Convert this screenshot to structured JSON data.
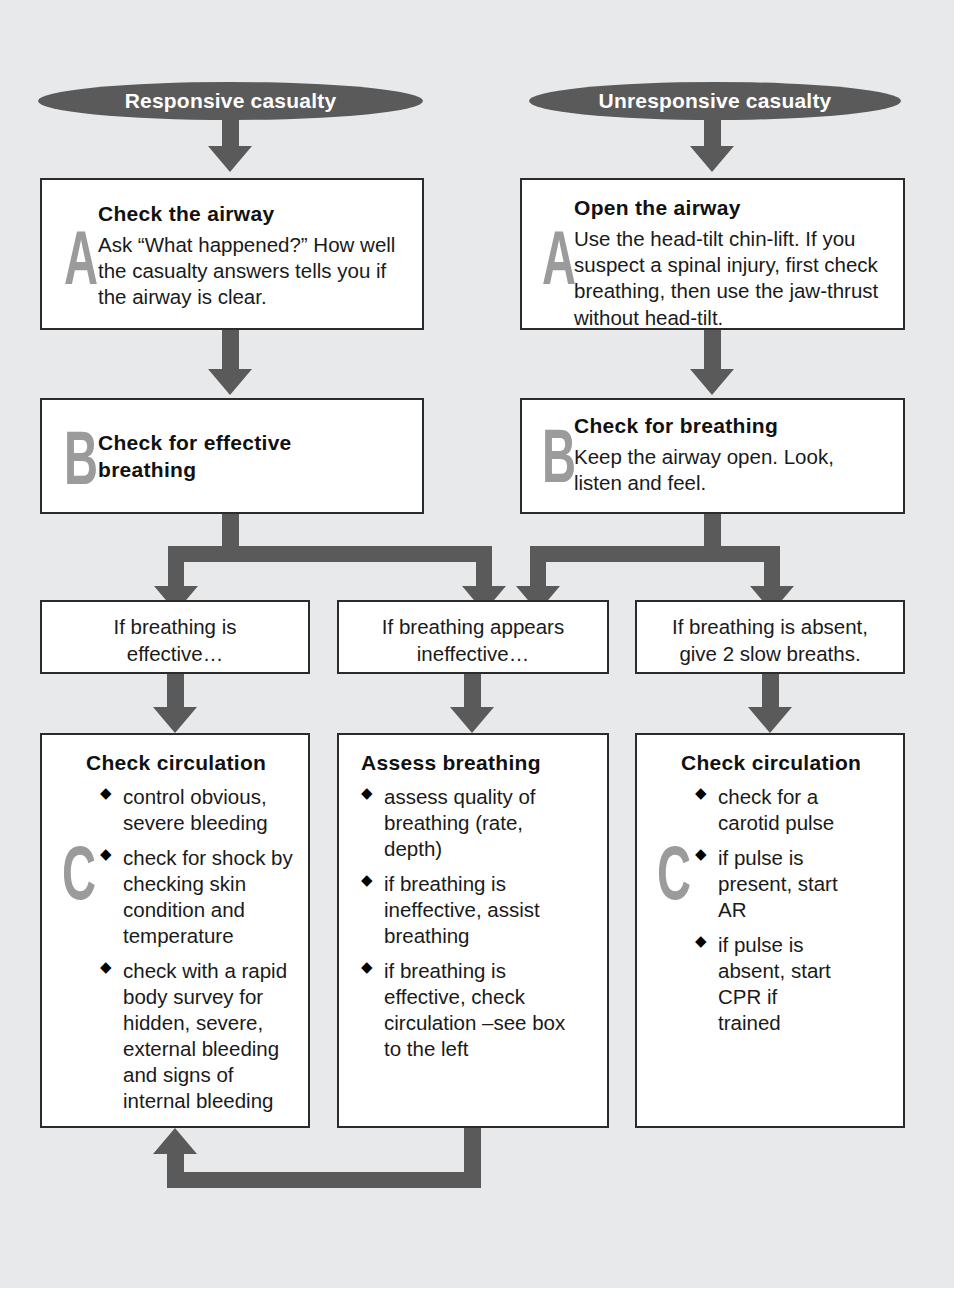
{
  "colors": {
    "background": "#e8e9ea",
    "arrow": "#5a5a5a",
    "ellipse_fill": "#5a5a5a",
    "ellipse_text": "#ffffff",
    "box_border": "#2b2b2b",
    "box_fill": "#ffffff",
    "big_letter": "#9b9b9b",
    "text": "#1a1a1a"
  },
  "diagram": {
    "type": "flowchart",
    "columns": [
      {
        "name": "responsive",
        "start_label": "Responsive casualty"
      },
      {
        "name": "unresponsive",
        "start_label": "Unresponsive casualty"
      }
    ],
    "start_nodes": {
      "left": "Responsive casualty",
      "right": "Unresponsive casualty"
    },
    "step_a": {
      "left": {
        "letter": "A",
        "title": "Check the airway",
        "body": "Ask “What happened?” How well the casualty answers tells you if the airway is clear."
      },
      "right": {
        "letter": "A",
        "title": "Open the airway",
        "body": "Use the head-tilt chin-lift. If you suspect a spinal injury, first check breathing, then use the jaw-thrust without head-tilt."
      }
    },
    "step_b": {
      "left": {
        "letter": "B",
        "title": "Check for effective breathing",
        "body": ""
      },
      "right": {
        "letter": "B",
        "title": "Check for breathing",
        "body": "Keep the airway open. Look, listen and feel."
      }
    },
    "conditions": [
      {
        "id": "effective",
        "line1": "If breathing is",
        "line2": "effective…"
      },
      {
        "id": "ineffective",
        "line1": "If breathing appears",
        "line2": "ineffective…"
      },
      {
        "id": "absent",
        "line1": "If breathing is absent,",
        "line2": "give 2 slow breaths."
      }
    ],
    "step_c": [
      {
        "id": "check-circulation-left",
        "letter": "C",
        "title": "Check circulation",
        "bullets": [
          "control obvious, severe bleeding",
          "check for shock by checking skin condition and temperature",
          "check with a rapid body survey for hidden, severe, external bleeding and signs of internal bleeding"
        ]
      },
      {
        "id": "assess-breathing",
        "letter": "",
        "title": "Assess breathing",
        "bullets": [
          "assess quality of breathing (rate, depth)",
          "if breathing is ineffective, assist breathing",
          "if breathing is effective, check circulation –see box to the left"
        ]
      },
      {
        "id": "check-circulation-right",
        "letter": "C",
        "title": "Check circulation",
        "bullets": [
          "check for a carotid pulse",
          "if pulse is present, start AR",
          "if pulse is absent, start CPR if trained"
        ]
      }
    ]
  }
}
